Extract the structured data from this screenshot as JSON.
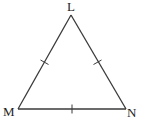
{
  "diagram": {
    "type": "equilateral-triangle",
    "stroke_color": "#3a3a3a",
    "vertices": {
      "L": {
        "label": "L",
        "x": 71,
        "y": 15
      },
      "M": {
        "label": "M",
        "x": 18,
        "y": 109
      },
      "N": {
        "label": "N",
        "x": 126,
        "y": 109
      }
    },
    "tick_marks": [
      {
        "side": "LM",
        "count": 1
      },
      {
        "side": "LN",
        "count": 1
      },
      {
        "side": "MN",
        "count": 1
      }
    ]
  }
}
